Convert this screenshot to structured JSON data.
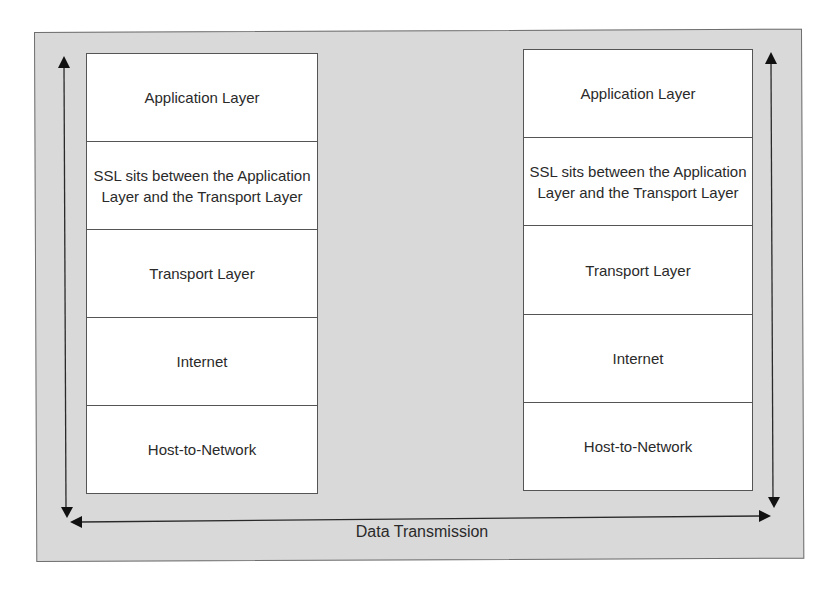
{
  "diagram": {
    "left_stack": {
      "layers": [
        {
          "label": "Application Layer"
        },
        {
          "label": "SSL sits between the Application Layer and the Transport Layer"
        },
        {
          "label": "Transport Layer"
        },
        {
          "label": "Internet"
        },
        {
          "label": "Host-to-Network"
        }
      ]
    },
    "right_stack": {
      "layers": [
        {
          "label": "Application Layer"
        },
        {
          "label": "SSL sits between the Application Layer and the Transport Layer"
        },
        {
          "label": "Transport Layer"
        },
        {
          "label": "Internet"
        },
        {
          "label": "Host-to-Network"
        }
      ]
    },
    "caption": "Data Transmission",
    "arrows": [
      {
        "name": "left-vertical",
        "direction": "bidirectional-vertical"
      },
      {
        "name": "right-vertical",
        "direction": "bidirectional-vertical"
      },
      {
        "name": "horizontal",
        "direction": "bidirectional-horizontal"
      }
    ],
    "colors": {
      "frame_background": "#d9d9d9",
      "frame_border": "#6e6e6e",
      "layer_background": "#ffffff",
      "line": "#2a2a2a"
    }
  }
}
